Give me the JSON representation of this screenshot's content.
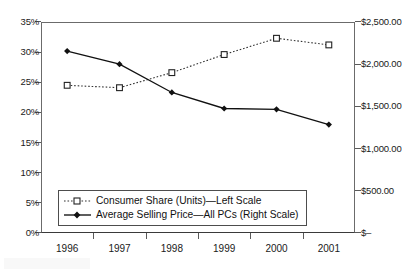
{
  "chart_data": {
    "type": "line",
    "title": "",
    "xlabel": "",
    "categories": [
      "1996",
      "1997",
      "1998",
      "1999",
      "2000",
      "2001"
    ],
    "grid": false,
    "legend_position": "inside-bottom-left",
    "series": [
      {
        "name": "Consumer Share (Units)—Left Scale",
        "axis": "left",
        "unit": "%",
        "marker": "open-square",
        "line_style": "dotted",
        "color": "#333333",
        "values": [
          24.5,
          24.1,
          26.6,
          29.6,
          32.3,
          31.2
        ]
      },
      {
        "name": "Average Selling Price—All PCs (Right Scale)",
        "axis": "right",
        "unit": "$",
        "marker": "filled-diamond",
        "line_style": "solid",
        "color": "#111111",
        "values": [
          2155,
          2000,
          1665,
          1475,
          1465,
          1285
        ]
      }
    ],
    "axes": {
      "left": {
        "label": "",
        "ylim": [
          0,
          35
        ],
        "tick_values": [
          0,
          5,
          10,
          15,
          20,
          25,
          30,
          35
        ],
        "tick_labels": [
          "0%",
          "5%",
          "10%",
          "15%",
          "20%",
          "25%",
          "30%",
          "35%"
        ]
      },
      "right": {
        "label": "",
        "ylim": [
          0,
          2500
        ],
        "tick_values": [
          0,
          500,
          1000,
          1500,
          2000,
          2500
        ],
        "tick_labels": [
          "$–",
          "$500.00",
          "$1,000.00",
          "$1,500.00",
          "$2,000.00",
          "$2,500.00"
        ]
      }
    }
  },
  "legend": {
    "items": [
      {
        "label": "Consumer Share (Units)—Left Scale"
      },
      {
        "label": "Average Selling Price—All PCs (Right Scale)"
      }
    ]
  }
}
